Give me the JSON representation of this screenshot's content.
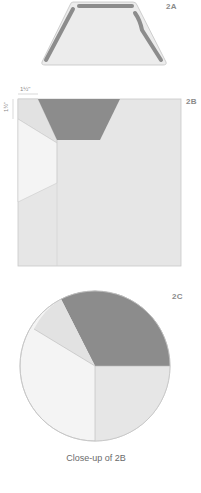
{
  "figures": {
    "a": {
      "label": "2A"
    },
    "b": {
      "label": "2B",
      "dim_top": "1½\"",
      "dim_left": "1½\""
    },
    "c": {
      "label": "2C",
      "caption": "Close-up of 2B"
    }
  },
  "colors": {
    "dark": "#8c8c8c",
    "mid": "#e3e3e3",
    "light": "#ececec",
    "white": "#f6f6f6",
    "outline": "#b8b8b8",
    "label": "#8a8a8a"
  }
}
